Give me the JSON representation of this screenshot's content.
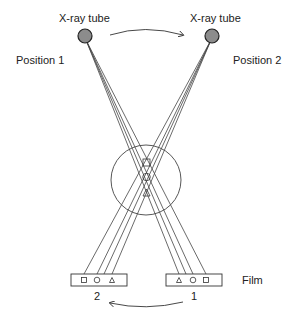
{
  "diagram": {
    "labels": {
      "tube_left": "X-ray tube",
      "tube_right": "X-ray tube",
      "position_left": "Position 1",
      "position_right": "Position 2",
      "film": "Film",
      "film_left_number": "2",
      "film_right_number": "1"
    },
    "objects": [
      "square",
      "circle",
      "triangle"
    ],
    "film_left_order": [
      "square",
      "circle",
      "triangle"
    ],
    "film_right_order": [
      "triangle",
      "circle",
      "square"
    ],
    "colors": {
      "tube_fill": "#8c8c8c",
      "line": "#333333",
      "text": "#222222"
    }
  }
}
